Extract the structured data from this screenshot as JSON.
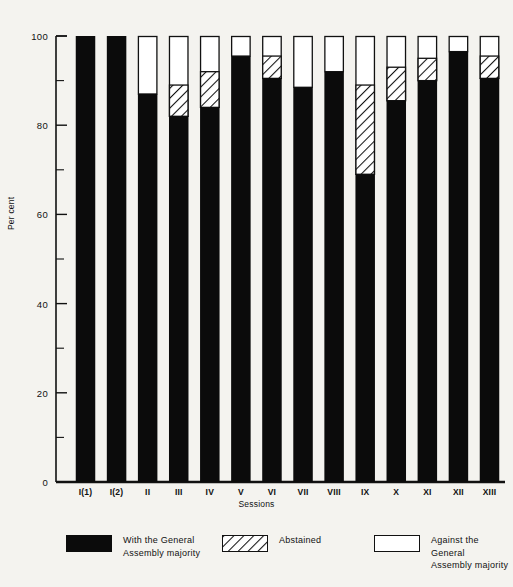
{
  "colors": {
    "background": "#f4f3ef",
    "ink": "#111111",
    "solid_fill": "#0b0b0b",
    "open_fill": "#ffffff",
    "hatch_line": "#111111"
  },
  "chart_data": {
    "type": "bar",
    "subtype": "stacked-column",
    "title": "",
    "xlabel": "Sessions",
    "ylabel": "Per cent",
    "ylim": [
      0,
      100
    ],
    "ytick_major": [
      0,
      20,
      40,
      60,
      80,
      100
    ],
    "ytick_minor": [
      10,
      30,
      50,
      70,
      90
    ],
    "grid": false,
    "legend_position": "bottom",
    "categories": [
      "I(1)",
      "I(2)",
      "II",
      "III",
      "IV",
      "V",
      "VI",
      "VII",
      "VIII",
      "IX",
      "X",
      "XI",
      "XII",
      "XIII"
    ],
    "series": [
      {
        "name": "With the General Assembly majority",
        "style": "solid",
        "values": [
          100,
          100,
          87,
          82,
          84,
          95.5,
          90.5,
          88.5,
          92,
          69,
          85.5,
          90,
          96.5,
          90.5
        ]
      },
      {
        "name": "Abstained",
        "style": "hatched",
        "values": [
          0,
          0,
          0,
          7,
          8,
          0,
          5,
          0,
          0,
          20,
          7.5,
          5,
          0,
          5
        ]
      },
      {
        "name": "Against the General Assembly majority",
        "style": "open",
        "values": [
          0,
          0,
          13,
          11,
          8,
          4.5,
          4.5,
          11.5,
          8,
          11,
          7,
          5,
          3.5,
          4.5
        ]
      }
    ],
    "cumulative_tops": {
      "note": "top of solid segment, then top of hatched segment, per category",
      "solid_top": [
        100,
        100,
        87,
        82,
        84,
        95.5,
        90.5,
        88.5,
        92,
        69,
        85.5,
        90,
        96.5,
        90.5
      ],
      "hatched_top": [
        100,
        100,
        87,
        89,
        92,
        95.5,
        95.5,
        88.5,
        92,
        89,
        93,
        95,
        96.5,
        95.5
      ]
    }
  },
  "legend": {
    "entries": [
      {
        "label": "With the General\nAssembly majority",
        "style": "solid"
      },
      {
        "label": "Abstained",
        "style": "hatched"
      },
      {
        "label": "Against the General\nAssembly majority",
        "style": "open"
      }
    ]
  }
}
